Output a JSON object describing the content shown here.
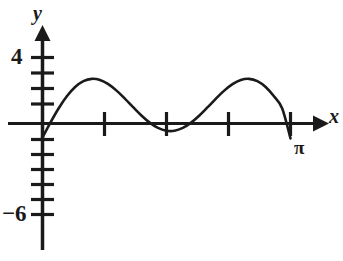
{
  "figure": {
    "kind": "cartesian-graph",
    "background_color": "#ffffff",
    "ink_color": "#1a1a1a",
    "width": 343,
    "height": 261
  },
  "axes": {
    "x_axis": {
      "name": "x-axis",
      "label": "x",
      "arrow": "right",
      "tick_count": 4,
      "tick_labels": [
        "",
        "",
        "",
        "π"
      ]
    },
    "y_axis": {
      "name": "y-axis",
      "label": "y",
      "arrow": "up",
      "tick_labels": [
        "4",
        "−6"
      ]
    }
  },
  "labels": {
    "y_axis_label": "y",
    "x_axis_label": "x",
    "y_tick_positive": "4",
    "y_tick_negative": "−6",
    "x_tick_pi": "π"
  },
  "chart_data": {
    "type": "line",
    "title": "",
    "xlabel": "x",
    "ylabel": "y",
    "xlim": [
      0,
      3.14159265
    ],
    "ylim": [
      -6,
      4
    ],
    "grid": false,
    "legend": null,
    "x_tick_values": [
      0.7853981,
      1.5707963,
      2.3561944,
      3.1415926
    ],
    "x_tick_labels": [
      "",
      "",
      "",
      "π"
    ],
    "y_tick_values": [
      4,
      -6
    ],
    "y_tick_labels": [
      "4",
      "−6"
    ],
    "y_minor_tick_step": 1,
    "series": [
      {
        "name": "curve",
        "expression": "y = 5 sin(2x) - 1",
        "amplitude": 5,
        "vertical_shift": -1,
        "period": 3.14159265,
        "maximum": {
          "x": 0.7853981,
          "y": 4
        },
        "minimum": {
          "x": 2.3561944,
          "y": -6
        },
        "zeros": [
          0.1013,
          1.4695,
          3.0411
        ],
        "x": [
          0.0,
          0.1047,
          0.2094,
          0.3142,
          0.4189,
          0.5236,
          0.6283,
          0.733,
          0.8378,
          0.9425,
          1.0472,
          1.1519,
          1.2566,
          1.3614,
          1.4661,
          1.5708,
          1.6755,
          1.7802,
          1.885,
          1.9897,
          2.0944,
          2.1991,
          2.3038,
          2.4086,
          2.5133,
          2.618,
          2.7227,
          2.8274,
          2.9322,
          3.0369,
          3.1416
        ],
        "y": [
          -1.0,
          0.01,
          0.941,
          1.7302,
          2.3301,
          2.7101,
          2.8587,
          2.7846,
          2.5155,
          2.0951,
          1.5777,
          1.0223,
          0.4871,
          0.0254,
          -0.3161,
          -0.5,
          -0.5,
          -0.3161,
          0.0254,
          0.4871,
          1.0223,
          1.5777,
          2.0951,
          2.5155,
          2.7846,
          2.8587,
          2.7101,
          2.3301,
          1.7302,
          0.941,
          -1.0
        ]
      }
    ]
  }
}
